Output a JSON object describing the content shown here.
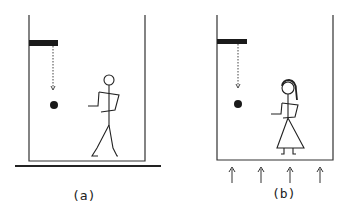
{
  "panels": [
    {
      "id": "a",
      "label": "(a)",
      "figure": "man",
      "description": "Box resting on ground; ball dropped from a ledge falls straight down"
    },
    {
      "id": "b",
      "label": "(b)",
      "figure": "woman",
      "description": "Box accelerating upward (arrows below); ball dropped from a ledge"
    }
  ],
  "colors": {
    "stroke": "#222222",
    "fill": "#1a1a1a",
    "background": "#ffffff"
  }
}
